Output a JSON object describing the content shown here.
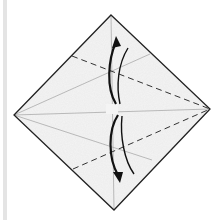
{
  "diagram": {
    "type": "origami-fold-step",
    "colors": {
      "paper_fill": "#f3f3f3",
      "outline": "#222222",
      "crease": "#9a9a9a",
      "fold_line": "#333333",
      "arrow": "#111111",
      "edge_bar": "#e4e4e4"
    },
    "square": {
      "top": [
        111,
        15
      ],
      "right": [
        210,
        109
      ],
      "bottom": [
        114,
        210
      ],
      "left": [
        14,
        115
      ]
    },
    "creases": [
      {
        "kind": "valley-dashed",
        "from": [
          72,
          56
        ],
        "to": [
          210,
          109
        ]
      },
      {
        "kind": "valley-dashed",
        "from": [
          73,
          169
        ],
        "to": [
          210,
          109
        ]
      },
      {
        "kind": "existing",
        "from": [
          14,
          115
        ],
        "to": [
          150,
          54
        ]
      },
      {
        "kind": "existing",
        "from": [
          14,
          115
        ],
        "to": [
          152,
          160
        ]
      },
      {
        "kind": "existing",
        "from": [
          14,
          115
        ],
        "to": [
          210,
          109
        ]
      },
      {
        "kind": "existing",
        "from": [
          111,
          15
        ],
        "to": [
          114,
          210
        ]
      }
    ],
    "arrows": [
      {
        "name": "fold-up-arrow",
        "direction": "up"
      },
      {
        "name": "fold-down-arrow",
        "direction": "down"
      }
    ]
  }
}
